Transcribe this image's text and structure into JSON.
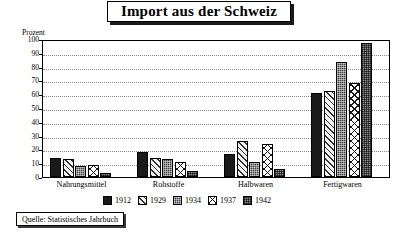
{
  "title": "Import aus der Schweiz",
  "source": "Quelle: Statistisches Jahrbuch",
  "axis_unit": "Prozent",
  "colors": {
    "s1912": "#1a1a1a",
    "s1929": "#f2f2f2",
    "s1934": "#3d3d3d",
    "s1937": "#ffffff",
    "s1942": "#8c8c8c",
    "frame": "#000000",
    "grid": "#8a8a8a",
    "background": "#ffffff"
  },
  "chart_data": {
    "type": "bar",
    "title": "Import aus der Schweiz",
    "xlabel": "",
    "ylabel": "Prozent",
    "ylim": [
      0,
      100
    ],
    "yticks": [
      0,
      10,
      20,
      30,
      40,
      50,
      60,
      70,
      80,
      90,
      100
    ],
    "grid": true,
    "legend_position": "bottom",
    "categories": [
      "Nahrungsmittel",
      "Rohstoffe",
      "Halbwaren",
      "Fertigwaren"
    ],
    "series": [
      {
        "name": "1912",
        "values": [
          14,
          18,
          17,
          61
        ]
      },
      {
        "name": "1929",
        "values": [
          13,
          14,
          26,
          62
        ]
      },
      {
        "name": "1934",
        "values": [
          8,
          13,
          11,
          83
        ]
      },
      {
        "name": "1937",
        "values": [
          9,
          11,
          24,
          68
        ]
      },
      {
        "name": "1942",
        "values": [
          3,
          4,
          6,
          97
        ]
      }
    ]
  }
}
